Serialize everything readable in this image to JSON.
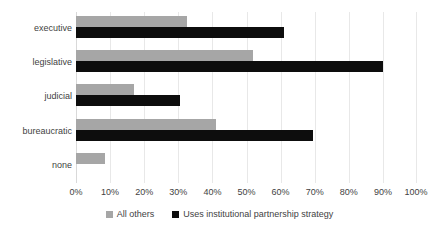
{
  "chart_data": {
    "type": "bar",
    "orientation": "horizontal",
    "title": "",
    "subtitle": "",
    "xlabel": "",
    "ylabel": "",
    "xlim": [
      0,
      100
    ],
    "xticks": [
      0,
      10,
      20,
      30,
      40,
      50,
      60,
      70,
      80,
      90,
      100
    ],
    "xtick_labels": [
      "0%",
      "10%",
      "20%",
      "30%",
      "40%",
      "50%",
      "60%",
      "70%",
      "80%",
      "90%",
      "100%"
    ],
    "categories": [
      "executive",
      "legislative",
      "judicial",
      "bureaucratic",
      "none"
    ],
    "grid": "vertical",
    "legend_position": "bottom-center",
    "series": [
      {
        "name": "All others",
        "color": "#a6a6a6",
        "values": [
          32.5,
          52.0,
          17.0,
          41.0,
          8.5
        ]
      },
      {
        "name": "Uses institutional partnership strategy",
        "color": "#0d0d0d",
        "values": [
          61.0,
          90.0,
          30.5,
          69.5,
          0
        ]
      }
    ]
  },
  "legend": {
    "items": [
      {
        "label": "All others",
        "swatch_name": "legend-swatch-all-others"
      },
      {
        "label": "Uses institutional partnership strategy",
        "swatch_name": "legend-swatch-partnership"
      }
    ]
  }
}
